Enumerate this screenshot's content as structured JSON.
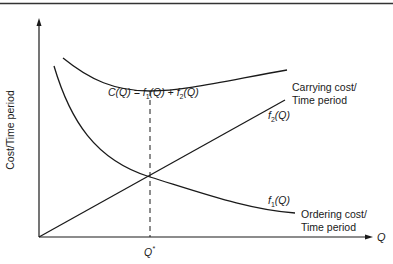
{
  "diagram": {
    "type": "economic-order-quantity-cost-curves",
    "axes": {
      "x_label": "Q",
      "y_label": "Cost/Time period",
      "optimal_marker": "Q*"
    },
    "curves": [
      {
        "id": "total-cost",
        "label": "C(Q) = f1(Q) + f2(Q)",
        "shape": "U-shaped, minimum at Q*"
      },
      {
        "id": "carrying-cost",
        "label": "f2(Q)",
        "description": "Carrying cost/Time period",
        "shape": "increasing straight line from origin"
      },
      {
        "id": "ordering-cost",
        "label": "f1(Q)",
        "description": "Ordering cost/Time period",
        "shape": "decreasing convex curve"
      }
    ],
    "labels": {
      "total_cost_C": "C(Q) = ",
      "total_cost_f1": "f",
      "total_cost_f1_sub": "1",
      "total_cost_mid": "(Q) + ",
      "total_cost_f2": "f",
      "total_cost_f2_sub": "2",
      "total_cost_end": "(Q)",
      "f2_label": "f",
      "f2_sub": "2",
      "f2_arg": "(Q)",
      "f1_label": "f",
      "f1_sub": "1",
      "f1_arg": "(Q)",
      "carrying_line1": "Carrying cost/",
      "carrying_line2": "Time period",
      "ordering_line1": "Ordering cost/",
      "ordering_line2": "Time period",
      "x_axis": "Q",
      "q_star": "Q",
      "q_star_sup": "*",
      "y_axis": "Cost/Time period"
    },
    "colors": {
      "ink": "#1a1a1a",
      "background": "#ffffff"
    }
  }
}
